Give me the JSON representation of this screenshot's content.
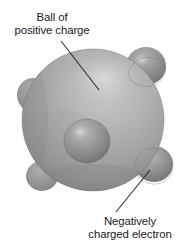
{
  "figure": {
    "background_color": "#ffffff"
  },
  "labels": {
    "positive_charge": {
      "line1": "Ball of",
      "line2": "positive charge"
    },
    "electron": {
      "line1": "Negatively",
      "line2": "charged electron"
    }
  },
  "colors": {
    "sphere_light": "#bdbdbd",
    "sphere_mid": "#a6a6a6",
    "sphere_dark": "#7e7e7e",
    "sphere_edge": "#6e6e6e",
    "electron_light": "#b0b0b0",
    "electron_mid": "#909090",
    "electron_dark": "#6a6a6a",
    "leader_line": "#2b2b2b",
    "text": "#1a1a1a"
  },
  "diagram": {
    "main_sphere": {
      "name": "ball-of-positive-charge",
      "cx": 93,
      "cy": 120,
      "r": 71
    },
    "electrons": [
      {
        "name": "electron-top-right",
        "cx": 145,
        "cy": 66,
        "r": 19
      },
      {
        "name": "electron-center",
        "cx": 87,
        "cy": 141,
        "r": 22
      },
      {
        "name": "electron-bottom-right",
        "cx": 153,
        "cy": 163,
        "r": 18
      },
      {
        "name": "electron-left-upper",
        "cx": 32,
        "cy": 94,
        "r": 15
      },
      {
        "name": "electron-bottom-left",
        "cx": 41,
        "cy": 177,
        "r": 15
      }
    ],
    "leader_lines": [
      {
        "name": "leader-line-positive-charge",
        "x1": 61,
        "y1": 41,
        "x2": 99,
        "y2": 90
      },
      {
        "name": "leader-line-electron",
        "x1": 116,
        "y1": 212,
        "x2": 150,
        "y2": 170
      }
    ]
  }
}
